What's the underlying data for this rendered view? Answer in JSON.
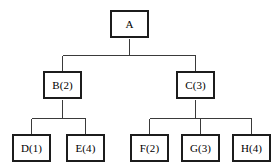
{
  "diagram": {
    "type": "tree",
    "title": "",
    "background_color": "#ffffff",
    "node_fill_color": "#ffffff",
    "node_border_color": "#1c1c1c",
    "edge_color": "#3a3a3a",
    "text_color": "#000000",
    "levels": 3,
    "nodes": [
      {
        "id": "A",
        "label": "A",
        "level": 0,
        "parent": null,
        "x": 110,
        "y": 10,
        "w": 39,
        "h": 28
      },
      {
        "id": "B",
        "label": "B(2)",
        "level": 1,
        "parent": "A",
        "x": 43,
        "y": 71,
        "w": 39,
        "h": 28
      },
      {
        "id": "C",
        "label": "C(3)",
        "level": 1,
        "parent": "A",
        "x": 176,
        "y": 71,
        "w": 39,
        "h": 28
      },
      {
        "id": "D",
        "label": "D(1)",
        "level": 2,
        "parent": "B",
        "x": 12,
        "y": 134,
        "w": 39,
        "h": 28
      },
      {
        "id": "E",
        "label": "E(4)",
        "level": 2,
        "parent": "B",
        "x": 66,
        "y": 134,
        "w": 39,
        "h": 28
      },
      {
        "id": "F",
        "label": "F(2)",
        "level": 2,
        "parent": "C",
        "x": 130,
        "y": 134,
        "w": 39,
        "h": 28
      },
      {
        "id": "G",
        "label": "G(3)",
        "level": 2,
        "parent": "C",
        "x": 181,
        "y": 134,
        "w": 39,
        "h": 28
      },
      {
        "id": "H",
        "label": "H(4)",
        "level": 2,
        "parent": "C",
        "x": 232,
        "y": 134,
        "w": 39,
        "h": 28
      }
    ],
    "edges": [
      {
        "from": "A",
        "to": "B"
      },
      {
        "from": "A",
        "to": "C"
      },
      {
        "from": "B",
        "to": "D"
      },
      {
        "from": "B",
        "to": "E"
      },
      {
        "from": "C",
        "to": "F"
      },
      {
        "from": "C",
        "to": "G"
      },
      {
        "from": "C",
        "to": "H"
      }
    ]
  }
}
